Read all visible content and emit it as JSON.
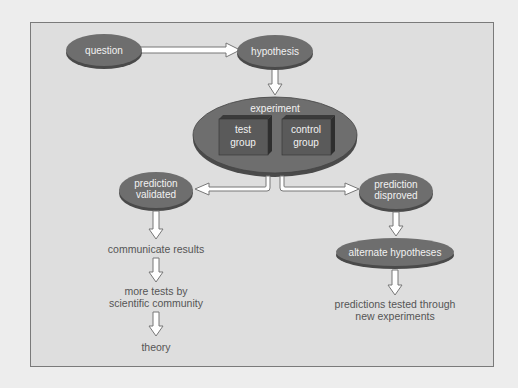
{
  "diagram": {
    "nodes": {
      "question": "question",
      "hypothesis": "hypothesis",
      "experiment": "experiment",
      "test_group_1": "test",
      "test_group_2": "group",
      "control_group_1": "control",
      "control_group_2": "group",
      "validated_1": "prediction",
      "validated_2": "validated",
      "disproved_1": "prediction",
      "disproved_2": "disproved",
      "alternate": "alternate hypotheses",
      "communicate": "communicate results",
      "more_tests_1": "more tests by",
      "more_tests_2": "scientific community",
      "theory": "theory",
      "predictions_tested_1": "predictions tested through",
      "predictions_tested_2": "new experiments"
    },
    "colors": {
      "node_fill": "#6e6e6e",
      "node_shadow": "#4a4a4a",
      "frame_bg": "#dedede",
      "page_bg": "#ededed",
      "box_fill": "#5a5a5a"
    }
  }
}
